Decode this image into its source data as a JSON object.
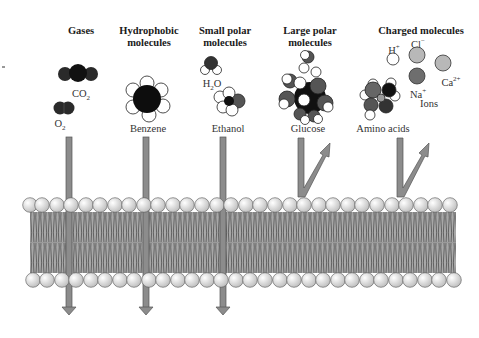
{
  "columns": [
    {
      "id": "gases",
      "header_line1": "Gases",
      "header_line2": "",
      "molecules": [
        "CO2",
        "O2"
      ]
    },
    {
      "id": "hydrophobic",
      "header_line1": "Hydrophobic",
      "header_line2": "molecules",
      "molecules": [
        "Benzene"
      ]
    },
    {
      "id": "small-polar",
      "header_line1": "Small polar",
      "header_line2": "molecules",
      "molecules": [
        "H2O",
        "Ethanol"
      ]
    },
    {
      "id": "large-polar",
      "header_line1": "Large polar",
      "header_line2": "molecules",
      "molecules": [
        "Glucose"
      ]
    },
    {
      "id": "charged",
      "header_line1": "Charged molecules",
      "header_line2": "",
      "molecules": [
        "Amino acids",
        "H+",
        "Cl−",
        "Na+",
        "Ca2+"
      ],
      "ions_label": "Ions"
    }
  ],
  "labels": {
    "co2": "CO",
    "co2_sub": "2",
    "o2": "O",
    "o2_sub": "2",
    "benzene": "Benzene",
    "h2o_h": "H",
    "h2o_sub": "2",
    "h2o_o": "O",
    "ethanol": "Ethanol",
    "glucose": "Glucose",
    "amino_acids": "Amino acids",
    "h_plus": "H",
    "h_plus_sup": "+",
    "cl": "Cl",
    "cl_sup": "−",
    "na": "Na",
    "na_sup": "+",
    "ca": "Ca",
    "ca_sup": "2+",
    "ions": "Ions"
  },
  "outcomes": {
    "gases": "passes through",
    "hydrophobic": "passes through",
    "small-polar": "passes through",
    "large-polar": "blocked (reflected)",
    "charged": "blocked (reflected)"
  },
  "colors": {
    "arrow_fill": "#8c8c8c",
    "arrow_stroke": "#555555",
    "head_fill": "#e6e6e6",
    "tail_fill": "#9a9a9a",
    "dark_atom": "#1a1a1a",
    "mid_atom": "#6a6a6a",
    "light_ion": "#b5b5b5"
  }
}
